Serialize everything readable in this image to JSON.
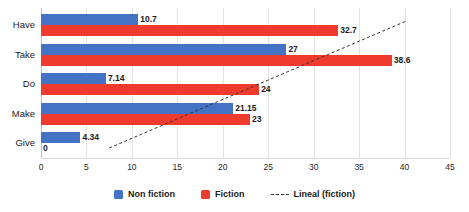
{
  "chart_data": {
    "type": "bar",
    "orientation": "horizontal",
    "title": "",
    "xlabel": "",
    "ylabel": "",
    "categories": [
      "Have",
      "Take",
      "Do",
      "Make",
      "Give"
    ],
    "series": [
      {
        "name": "Non fiction",
        "color": "#4472c4",
        "values": [
          10.7,
          27,
          7.14,
          21.15,
          4.34
        ]
      },
      {
        "name": "Fiction",
        "color": "#ee3b2e",
        "values": [
          32.7,
          38.6,
          24,
          23,
          0
        ]
      }
    ],
    "data_labels": {
      "Non fiction": [
        "10.7",
        "27",
        "7.14",
        "21.15",
        "4.34"
      ],
      "Fiction": [
        "32.7",
        "38.6",
        "24",
        "23",
        "0"
      ]
    },
    "trendline": {
      "name": "Lineal (fiction)",
      "style": "dashed",
      "color": "#333333",
      "x_start": 7.5,
      "x_end": 40.2
    },
    "xlim": [
      0,
      45
    ],
    "xticks": [
      0,
      5,
      10,
      15,
      20,
      25,
      30,
      35,
      40,
      45
    ],
    "xtick_labels": [
      "0",
      "5",
      "10",
      "15",
      "20",
      "25",
      "30",
      "35",
      "40",
      "45"
    ],
    "grid": true,
    "legend_position": "bottom",
    "legend": [
      "Non fiction",
      "Fiction",
      "Lineal (fiction)"
    ]
  }
}
